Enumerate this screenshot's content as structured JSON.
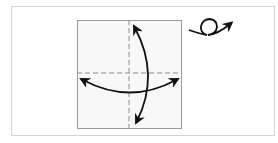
{
  "diagram": {
    "type": "origami-step",
    "elements": {
      "paper_square": {
        "fill": "#f8f8f8",
        "stroke": "#9a9a9a"
      },
      "crease_lines": [
        {
          "orientation": "vertical",
          "style": "dashed"
        },
        {
          "orientation": "horizontal",
          "style": "dashed"
        }
      ],
      "arrows": [
        {
          "name": "fold-unfold-vertical",
          "direction": "top-bottom",
          "double_headed": true
        },
        {
          "name": "fold-unfold-horizontal",
          "direction": "left-right",
          "double_headed": true
        }
      ],
      "turn_over_symbol": {
        "meaning": "turn over"
      }
    },
    "colors": {
      "ink": "#111111",
      "crease": "#8c8c8c",
      "frame": "#d4d4d4"
    }
  }
}
